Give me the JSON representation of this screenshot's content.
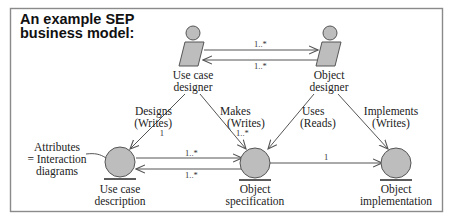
{
  "title": {
    "line1": "An example SEP",
    "line2": "business model:"
  },
  "colors": {
    "frame": "#8a8a8a",
    "shape_fill": "#bdbdbd",
    "shape_stroke": "#555555",
    "line": "#555555",
    "text": "#222222"
  },
  "actors": [
    {
      "id": "use-case-designer",
      "line1": "Use case",
      "line2": "designer"
    },
    {
      "id": "object-designer",
      "line1": "Object",
      "line2": "designer"
    }
  ],
  "entities": [
    {
      "id": "use-case-description",
      "line1": "Use case",
      "line2": "description"
    },
    {
      "id": "object-specification",
      "line1": "Object",
      "line2": "specification"
    },
    {
      "id": "object-implementation",
      "line1": "Object",
      "line2": "implementation"
    }
  ],
  "annotation": {
    "line1": "Attributes",
    "line2": "= Interaction",
    "line3": "diagrams"
  },
  "relationships": {
    "designer_to_designer": {
      "forward_mult": "1..*",
      "backward_mult": "1..*"
    },
    "designs": {
      "verb": "Designs",
      "mode": "(Writes)",
      "mult": "1"
    },
    "makes": {
      "verb": "Makes",
      "mode": "(Writes)",
      "mult": "1..*"
    },
    "uses": {
      "verb": "Uses",
      "mode": "(Reads)"
    },
    "implements": {
      "verb": "Implements",
      "mode": "(Writes)"
    },
    "desc_to_spec": {
      "forward_mult": "1..*",
      "backward_mult": "1..*"
    },
    "spec_to_impl": {
      "mult": "1"
    }
  }
}
